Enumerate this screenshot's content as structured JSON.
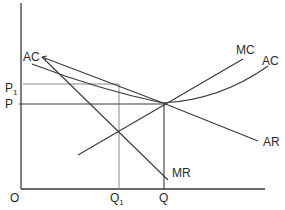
{
  "diagram": {
    "type": "economics-cost-revenue-diagram",
    "axes": {
      "origin_label": "O",
      "y_labels": {
        "p1": "P",
        "p1_sub": "1",
        "p": "P"
      },
      "x_labels": {
        "q1": "Q",
        "q1_sub": "1",
        "q": "Q"
      }
    },
    "curves": {
      "ac_left_label": "AC",
      "mc_label": "MC",
      "ac_right_label": "AC",
      "ar_label": "AR",
      "mr_label": "MR"
    },
    "colors": {
      "line": "#3a3a3a",
      "guide": "#8a8a8a",
      "text": "#2a2a2a",
      "background": "#ffffff"
    }
  }
}
